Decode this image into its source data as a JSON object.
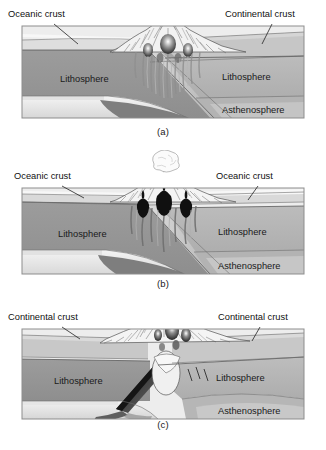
{
  "figure": {
    "type": "geological-cross-section-series"
  },
  "panels": [
    {
      "id": "a",
      "caption": "(a)",
      "boundary_type": "ocean-continent convergence",
      "labels": {
        "left_crust": "Oceanic crust",
        "right_crust": "Continental crust",
        "left_mantle": "Lithosphere",
        "right_mantle": "Lithosphere",
        "deep_layer": "Asthenosphere"
      }
    },
    {
      "id": "b",
      "caption": "(b)",
      "boundary_type": "ocean-ocean convergence",
      "labels": {
        "left_crust": "Oceanic crust",
        "right_crust": "Oceanic crust",
        "left_mantle": "Lithosphere",
        "right_mantle": "Lithosphere",
        "deep_layer": "Asthenosphere"
      }
    },
    {
      "id": "c",
      "caption": "(c)",
      "boundary_type": "continent-continent collision",
      "labels": {
        "left_crust": "Continental crust",
        "right_crust": "Continental crust",
        "left_mantle": "Lithosphere",
        "right_mantle": "Lithosphere",
        "deep_layer": "Asthenosphere"
      }
    }
  ],
  "colors": {
    "background": "#ffffff",
    "crust_light": "#e8e8e8",
    "crust_mid": "#c9c9c9",
    "lithosphere_left": "#9a9a9a",
    "lithosphere_right": "#b4b4b4",
    "asthenosphere": "#a8a8a8",
    "asthenosphere_light": "#efefef",
    "slab_dark": "#3a3a3a",
    "magma_black": "#111111",
    "outline": "#4a4a4a",
    "text": "#111111"
  }
}
